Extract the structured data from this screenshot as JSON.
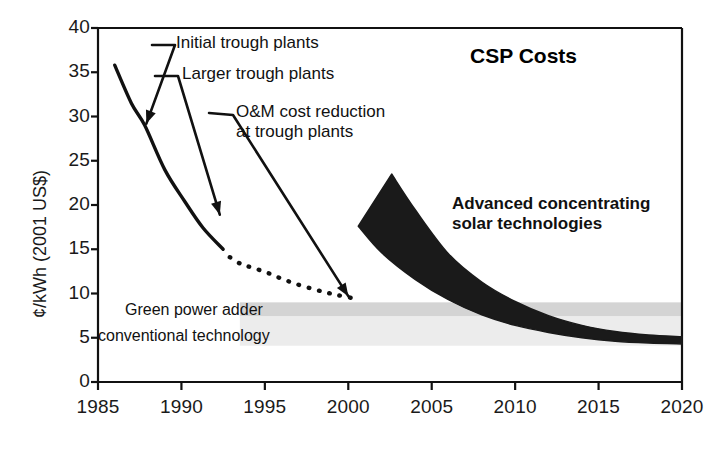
{
  "chart_data": {
    "type": "line",
    "title": "CSP Costs",
    "xlabel": "",
    "ylabel": "¢/kWh (2001 US$)",
    "xlim": [
      1985,
      2020
    ],
    "ylim": [
      0,
      40
    ],
    "xticks": [
      "1985",
      "1990",
      "1995",
      "2000",
      "2005",
      "2010",
      "2015",
      "2020"
    ],
    "yticks": [
      "0",
      "5",
      "10",
      "15",
      "20",
      "25",
      "30",
      "35",
      "40"
    ],
    "grid": false,
    "legend": "none",
    "series": [
      {
        "name": "Trough plant historical costs (solid)",
        "style": "solid-line",
        "points": [
          [
            1986.0,
            35.8
          ],
          [
            1987.0,
            31.5
          ],
          [
            1987.8,
            29.0
          ],
          [
            1989.0,
            24.0
          ],
          [
            1990.2,
            20.4
          ],
          [
            1991.3,
            17.4
          ],
          [
            1992.5,
            15.0
          ]
        ]
      },
      {
        "name": "Trough plant projected costs (dotted)",
        "style": "dotted-line",
        "points": [
          [
            1992.9,
            14.1
          ],
          [
            1993.6,
            13.3
          ],
          [
            1994.3,
            12.9
          ],
          [
            1995.2,
            12.3
          ],
          [
            1996.1,
            11.6
          ],
          [
            1997.0,
            11.0
          ],
          [
            1997.9,
            10.5
          ],
          [
            1998.7,
            10.1
          ],
          [
            1999.4,
            9.8
          ],
          [
            2000.2,
            9.5
          ]
        ]
      },
      {
        "name": "Advanced concentrating solar technologies (band)",
        "style": "filled-band",
        "upper": [
          [
            2002.6,
            23.5
          ],
          [
            2004.0,
            19.5
          ],
          [
            2006.0,
            14.5
          ],
          [
            2008.0,
            11.3
          ],
          [
            2010.0,
            9.1
          ],
          [
            2012.0,
            7.5
          ],
          [
            2014.0,
            6.4
          ],
          [
            2016.0,
            5.7
          ],
          [
            2018.0,
            5.3
          ],
          [
            2020.0,
            5.1
          ]
        ],
        "lower": [
          [
            2000.6,
            17.6
          ],
          [
            2002.0,
            14.6
          ],
          [
            2004.0,
            11.6
          ],
          [
            2006.0,
            9.3
          ],
          [
            2008.0,
            7.6
          ],
          [
            2010.0,
            6.4
          ],
          [
            2012.0,
            5.6
          ],
          [
            2014.0,
            5.0
          ],
          [
            2016.0,
            4.6
          ],
          [
            2018.0,
            4.4
          ],
          [
            2020.0,
            4.3
          ]
        ]
      }
    ],
    "bands": [
      {
        "name": "green-power-adder-band",
        "y_range": [
          7.4,
          9.0
        ],
        "x_range": [
          1993.5,
          2020
        ],
        "color": "#d4d4d4"
      },
      {
        "name": "conventional-technology-band",
        "y_range": [
          4.1,
          7.4
        ],
        "x_range": [
          1993.5,
          2020
        ],
        "color": "#ececec"
      }
    ],
    "annotations": [
      {
        "name": "initial-trough-plants",
        "text": "Initial trough plants",
        "target": [
          1987.9,
          29.2
        ],
        "label_xy": [
          1989.6,
          38.1
        ]
      },
      {
        "name": "larger-trough-plants",
        "text": "Larger trough plants",
        "target": [
          1992.3,
          18.9
        ],
        "label_xy": [
          1991.6,
          35.2
        ]
      },
      {
        "name": "om-cost-reduction-at-trough-plants",
        "text": "O&M cost reduction\nat trough plants",
        "line1": "O&M cost reduction",
        "line2": "at trough plants",
        "target": [
          2000.0,
          9.7
        ],
        "label_xy": [
          1995.0,
          30.3
        ]
      },
      {
        "name": "advanced-concentrating-solar-technologies",
        "line1": "Advanced concentrating",
        "line2": "solar technologies",
        "label_xy": [
          2006.2,
          18.0
        ]
      },
      {
        "name": "green-power-adder",
        "text": "Green power adder",
        "label_xy": [
          1990.0,
          8.7
        ]
      },
      {
        "name": "conventional-technology",
        "text": "conventional technology",
        "label_xy": [
          1989.6,
          5.7
        ]
      }
    ],
    "colors": {
      "ink": "#111111",
      "band_fill": "#1a1a1a",
      "grey_dark": "#d4d4d4",
      "grey_light": "#ececec",
      "background": "#ffffff"
    }
  }
}
